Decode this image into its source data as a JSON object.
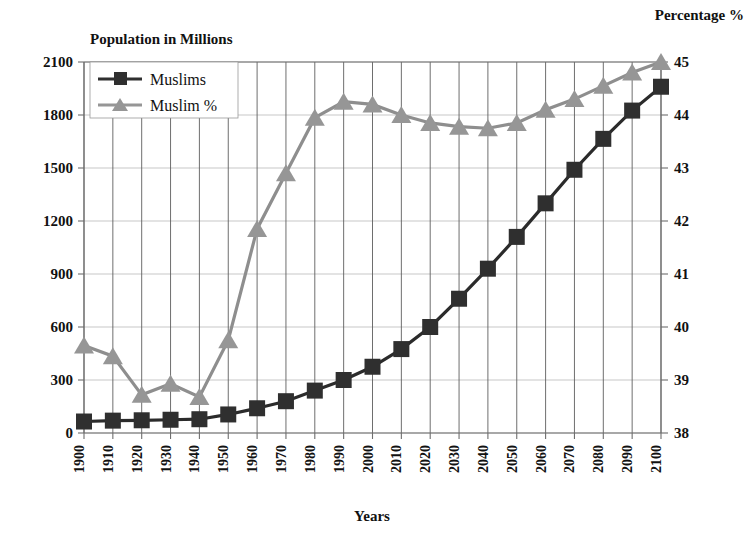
{
  "chart_data": {
    "type": "line",
    "title": "",
    "xlabel": "Years",
    "ylabel_left": "Population in Millions",
    "ylabel_right": "Percentage %",
    "grid": true,
    "legend_position": "top-left-inside",
    "x": [
      1900,
      1910,
      1920,
      1930,
      1940,
      1950,
      1960,
      1970,
      1980,
      1990,
      2000,
      2010,
      2020,
      2030,
      2040,
      2050,
      2060,
      2070,
      2080,
      2090,
      2100
    ],
    "categories": [
      "1900",
      "1910",
      "1920",
      "1930",
      "1940",
      "1950",
      "1960",
      "1970",
      "1980",
      "1990",
      "2000",
      "2010",
      "2020",
      "2030",
      "2040",
      "2050",
      "2060",
      "2070",
      "2080",
      "2090",
      "2100"
    ],
    "ylim_left": [
      0,
      2100
    ],
    "yticks_left": [
      0,
      300,
      600,
      900,
      1200,
      1500,
      1800,
      2100
    ],
    "ylim_right": [
      38,
      45
    ],
    "yticks_right": [
      38,
      39,
      40,
      41,
      42,
      43,
      44,
      45
    ],
    "series": [
      {
        "name": "Muslims",
        "axis": "left",
        "marker": "square",
        "color": "#2f2f2f",
        "values": [
          65,
          70,
          72,
          75,
          78,
          105,
          140,
          180,
          240,
          300,
          375,
          475,
          600,
          760,
          930,
          1110,
          1300,
          1490,
          1665,
          1825,
          1960
        ]
      },
      {
        "name": "Muslim %",
        "axis": "right",
        "marker": "triangle",
        "color": "#969696",
        "values": [
          39.65,
          39.45,
          38.72,
          38.93,
          38.68,
          39.75,
          41.85,
          42.9,
          43.95,
          44.25,
          44.2,
          44.0,
          43.85,
          43.78,
          43.75,
          43.85,
          44.1,
          44.3,
          44.55,
          44.8,
          45.0
        ]
      }
    ],
    "legend": [
      {
        "label": "Muslims",
        "color": "#2f2f2f",
        "marker": "square"
      },
      {
        "label": "Muslim %",
        "color": "#969696",
        "marker": "triangle"
      }
    ]
  },
  "labels": {
    "left_axis_title": "Population in Millions",
    "right_axis_title": "Percentage %",
    "x_axis_title": "Years"
  }
}
